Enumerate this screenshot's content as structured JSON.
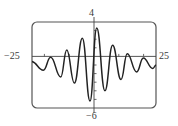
{
  "chart_data": {
    "type": "line",
    "title": "",
    "xlabel": "",
    "ylabel": "",
    "xlim": [
      -25,
      25
    ],
    "ylim": [
      -6,
      4
    ],
    "grid": false,
    "legend": null,
    "axis_labels": {
      "x_min": "−25",
      "x_max": "25",
      "y_max": "4",
      "y_min": "−6"
    },
    "x_ticks": [
      -20,
      -10,
      10,
      20
    ],
    "y_ticks": [
      -5,
      -4,
      -3,
      -2,
      -1,
      1,
      2,
      3
    ],
    "series": [
      {
        "name": "f(x)",
        "color": "#222222",
        "points": [
          [
            -25,
            -0.6
          ],
          [
            -20.4,
            -1.6
          ],
          [
            -17.5,
            -0.1
          ],
          [
            -13.4,
            -2.4
          ],
          [
            -11,
            0.75
          ],
          [
            -7.9,
            -3.1
          ],
          [
            -4.7,
            2.1
          ],
          [
            -1.6,
            -5.2
          ],
          [
            1.1,
            3.3
          ],
          [
            4.4,
            -4.0
          ],
          [
            7.5,
            1.3
          ],
          [
            10.9,
            -2.7
          ],
          [
            13.4,
            0.3
          ],
          [
            17.2,
            -1.8
          ],
          [
            19.9,
            -0.2
          ],
          [
            23.7,
            -1.4
          ],
          [
            25,
            -1.0
          ]
        ]
      }
    ]
  },
  "colors": {
    "frame": "#555555",
    "axis": "#444444",
    "curve": "#222222"
  }
}
